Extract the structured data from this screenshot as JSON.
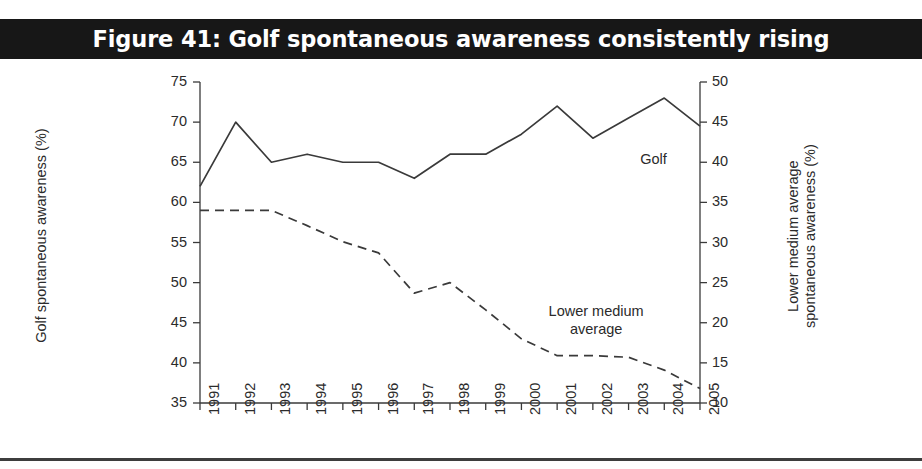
{
  "figure": {
    "title": "Figure 41: Golf spontaneous awareness consistently rising",
    "title_band_color": "#171717",
    "title_text_color": "#ffffff",
    "background_color": "#ffffff",
    "line_color": "#3a3a3a"
  },
  "chart_data": {
    "type": "line",
    "title": "Figure 41: Golf spontaneous awareness consistently rising",
    "xlabel": "",
    "ylabel": "Golf spontaneous awareness (%)",
    "y2label": "Lower medium average spontaneous awareness (%)",
    "grid": false,
    "legend": "inline-annotations",
    "x": [
      "1991",
      "1992",
      "1993",
      "1994",
      "1995",
      "1996",
      "1997",
      "1998",
      "1999",
      "2000",
      "2001",
      "2002",
      "2003",
      "2004",
      "2005"
    ],
    "xtick_labels": [
      "1991",
      "1992",
      "1993",
      "1994",
      "1995",
      "1996",
      "1997",
      "1998",
      "1999",
      "2000",
      "2001",
      "2002",
      "2003",
      "2004",
      "2005"
    ],
    "ylim": [
      35,
      75
    ],
    "ytick_labels": [
      "75",
      "70",
      "65",
      "60",
      "55",
      "50",
      "45",
      "40",
      "35"
    ],
    "yticks": [
      75,
      70,
      65,
      60,
      55,
      50,
      45,
      40,
      35
    ],
    "y2lim": [
      10,
      50
    ],
    "y2tick_labels": [
      "50",
      "45",
      "40",
      "35",
      "30",
      "25",
      "20",
      "15",
      "10"
    ],
    "y2ticks": [
      50,
      45,
      40,
      35,
      30,
      25,
      20,
      15,
      10
    ],
    "series": [
      {
        "name": "Golf",
        "axis": "left",
        "style": "solid",
        "annotation": "Golf",
        "values": [
          62,
          70,
          65,
          66,
          65,
          65,
          63,
          66,
          66,
          68.5,
          72,
          68,
          70.5,
          73,
          69.5
        ]
      },
      {
        "name": "Lower medium average",
        "axis": "right",
        "style": "dashed",
        "annotation": "Lower medium average",
        "values": [
          34,
          34,
          34,
          32.1,
          30.1,
          28.7,
          23.7,
          25,
          21.6,
          18,
          15.9,
          15.9,
          15.7,
          14.1,
          11.8
        ]
      }
    ],
    "annotations": [
      {
        "text": "Golf",
        "near_x": "2003",
        "series": "Golf"
      },
      {
        "text": "Lower medium average",
        "near_x": "2001",
        "series": "Lower medium average"
      }
    ]
  },
  "axes": {
    "left_title": "Golf spontaneous awareness (%)",
    "right_title_line1": "Lower medium average",
    "right_title_line2": "spontaneous awareness (%)"
  },
  "annotations": {
    "golf_label": "Golf",
    "lower_medium_line1": "Lower medium",
    "lower_medium_line2": "average"
  }
}
